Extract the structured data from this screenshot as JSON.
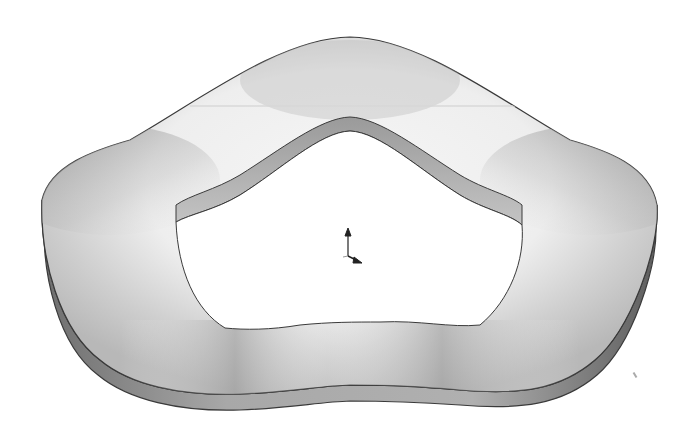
{
  "scene": {
    "description": "3D CAD render of a wavy ring washer viewed in isometric",
    "background_color": "#ffffff",
    "part": {
      "name": "wave-washer",
      "surface_light": "#f4f4f4",
      "surface_mid": "#c8c8c8",
      "surface_dark": "#8a8a8a",
      "edge_color": "#7a7a7a",
      "outline_color": "#3a3a3a"
    },
    "triad": {
      "icon": "coordinate-triad-icon",
      "color": "#222222"
    }
  }
}
